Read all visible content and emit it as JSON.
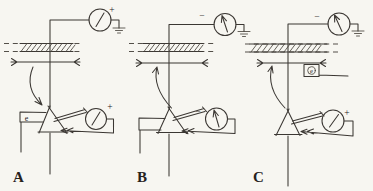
{
  "figure": {
    "colors": {
      "paper": "#f7f6f1",
      "ink": "#3b3733",
      "text": "#26221d"
    },
    "panels": {
      "a": {
        "label": "A",
        "top_meter": {
          "sign": "+",
          "needle": "deflected-right"
        },
        "bottom_meter": {
          "sign": "+",
          "needle": "deflected-right"
        },
        "electron_label": "e",
        "arrow_direction": "down-toward-electroscope"
      },
      "b": {
        "label": "B",
        "top_meter": {
          "sign": "−",
          "needle": "upright"
        },
        "bottom_meter": {
          "sign": "−",
          "needle": "upright"
        },
        "arrow_direction": "up-toward-bar"
      },
      "c": {
        "label": "C",
        "top_meter": {
          "sign": "−",
          "needle": "deflected-left"
        },
        "bottom_meter": {
          "sign": "+",
          "needle": "deflected-right"
        },
        "electron_source_label": "e",
        "arrow_direction": "up-toward-bar"
      }
    }
  }
}
